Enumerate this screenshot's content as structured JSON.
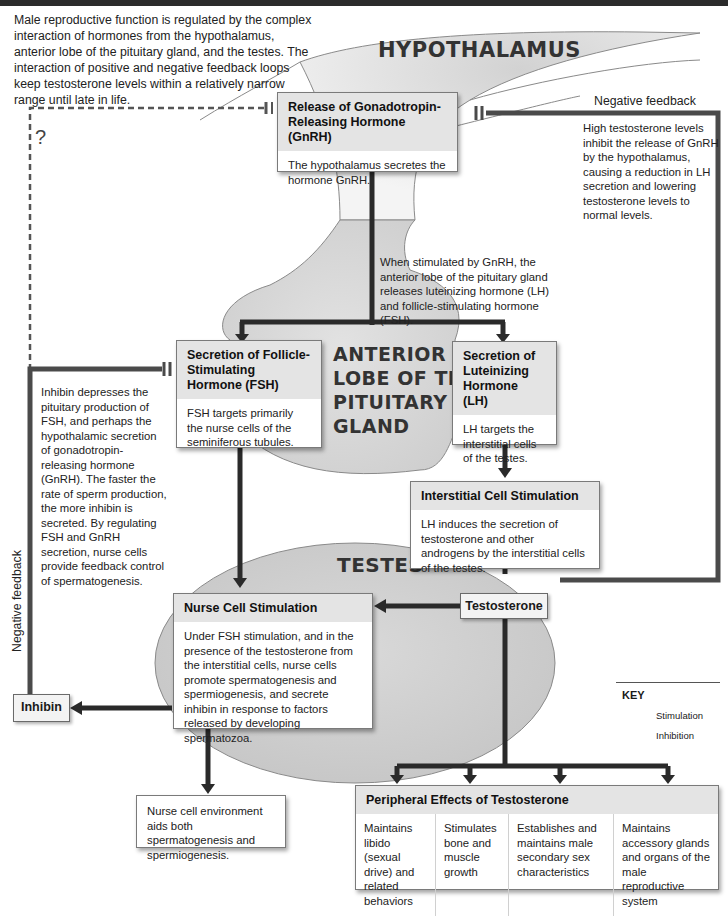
{
  "intro": "Male reproductive function is regulated by the complex interaction of hormones from the hypothalamus, anterior lobe of the pituitary gland, and the testes. The interaction of positive and negative feedback loops keep testosterone levels within a relatively narrow range until late in life.",
  "regions": {
    "hypothalamus": "HYPOTHALAMUS",
    "anterior_lobe": [
      "ANTERIOR",
      "LOBE OF THE",
      "PITUITARY",
      "GLAND"
    ],
    "testes": "TESTES"
  },
  "boxes": {
    "gnrh": {
      "title": "Release of Gonadotropin-Releasing Hormone (GnRH)",
      "body": "The hypothalamus secretes the hormone GnRH."
    },
    "fsh": {
      "title": "Secretion of Follicle-Stimulating Hormone (FSH)",
      "body": "FSH targets primarily the nurse cells of the seminiferous tubules."
    },
    "lh": {
      "title": "Secretion of Luteinizing Hormone (LH)",
      "body": "LH targets the interstitial cells of the testes."
    },
    "interstitial": {
      "title": "Interstitial Cell Stimulation",
      "body": "LH induces the secretion of testosterone and other androgens by the interstitial cells of the testes."
    },
    "nurse": {
      "title": "Nurse Cell Stimulation",
      "body": "Under FSH stimulation, and in the presence of the testosterone from the interstitial cells, nurse cells promote spermatogenesis and spermiogenesis, and secrete inhibin in response to factors released by developing spermatozoa."
    },
    "nurse_env": {
      "body": "Nurse cell environment aids both spermatogenesis and spermiogenesis."
    },
    "peripheral": {
      "title": "Peripheral Effects of Testosterone",
      "cells": [
        "Maintains libido (sexual drive) and related behaviors",
        "Stimulates bone and muscle growth",
        "Establishes and maintains male secondary sex characteristics",
        "Maintains accessory glands and organs of the male reproductive system"
      ]
    }
  },
  "small_boxes": {
    "testosterone": "Testosterone",
    "inhibin": "Inhibin"
  },
  "notes": {
    "pituitary_release": "When stimulated by GnRH, the anterior lobe of the pituitary gland releases luteinizing hormone (LH) and follicle-stimulating hormone (FSH).",
    "high_testosterone": "High testosterone levels inhibit the release of GnRH by the hypothalamus, causing a reduction in LH secretion and lowering testosterone levels to normal levels.",
    "inhibin": "Inhibin depresses the pituitary production of FSH, and perhaps the hypothalamic secretion of gonadotropin-releasing hormone (GnRH). The faster the rate of sperm production, the more inhibin is secreted. By regulating FSH and GnRH secretion, nurse cells provide feedback control of spermatogenesis."
  },
  "labels": {
    "negative_feedback_right": "Negative feedback",
    "negative_feedback_left": "Negative feedback",
    "unknown_pathway": "?"
  },
  "key": {
    "title": "KEY",
    "stimulation": "Stimulation",
    "inhibition": "Inhibition"
  },
  "colors": {
    "arrow": "#2a2a2a",
    "feedback_line": "#4a4a4a",
    "region_fill": "#d6d6d6",
    "box_header": "#e4e4e4"
  }
}
